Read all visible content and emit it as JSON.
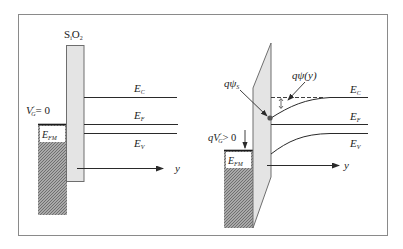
{
  "colors": {
    "frame": "#8a8a8a",
    "oxide_fill": "#e4e4e4",
    "oxide_stroke": "#6e6e6e",
    "line": "#2a2a2a",
    "metal_hatch": "#8c8c8c"
  },
  "left_panel": {
    "oxide_label": "SiO",
    "oxide_label_sub_i": "i",
    "oxide_label_sub_2": "2",
    "gate_voltage_label": "V",
    "gate_voltage_sup": "′",
    "gate_voltage_sub": "G",
    "gate_voltage_value": "= 0",
    "metal_fermi_label": "E",
    "metal_fermi_sub": "FM",
    "conduction_band_label": "E",
    "conduction_band_sub": "C",
    "fermi_level_label": "E",
    "fermi_level_sub": "F",
    "valence_band_label": "E",
    "valence_band_sub": "V",
    "axis_label": "y"
  },
  "right_panel": {
    "surface_potential_label": "qψ",
    "surface_potential_sub": "S",
    "potential_y_label": "qψ(y)",
    "gate_voltage_label": "qV",
    "gate_voltage_sup": "′",
    "gate_voltage_sub": "G",
    "gate_voltage_value": "> 0",
    "metal_fermi_label": "E",
    "metal_fermi_sub": "FM",
    "conduction_band_label": "E",
    "conduction_band_sub": "C",
    "fermi_level_label": "E",
    "fermi_level_sub": "F",
    "valence_band_label": "E",
    "valence_band_sub": "V",
    "axis_label": "y"
  }
}
